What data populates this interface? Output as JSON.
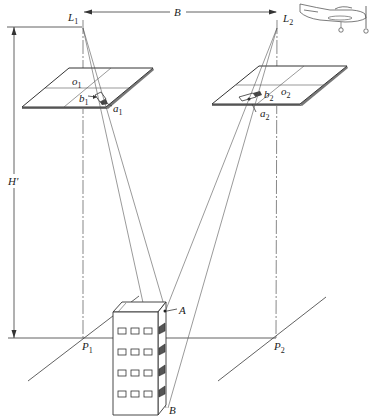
{
  "figure": {
    "labels": {
      "L1": {
        "main": "L",
        "sub": "1"
      },
      "L2": {
        "main": "L",
        "sub": "2"
      },
      "B": "B",
      "H": "H'",
      "o1": {
        "main": "o",
        "sub": "1"
      },
      "o2": {
        "main": "o",
        "sub": "2"
      },
      "a1": {
        "main": "a",
        "sub": "1"
      },
      "a2": {
        "main": "a",
        "sub": "2"
      },
      "b1": {
        "main": "b",
        "sub": "1"
      },
      "b2": {
        "main": "b",
        "sub": "2"
      },
      "P1": {
        "main": "P",
        "sub": "1"
      },
      "P2": {
        "main": "P",
        "sub": "2"
      },
      "A": "A",
      "Bpt": "B"
    },
    "elements": {
      "exposure_stations": [
        "L1",
        "L2"
      ],
      "air_base": "B",
      "flying_height": "H'",
      "photos": [
        "left photo (o1, a1, b1)",
        "right photo (o2, a2, b2)"
      ],
      "ground_nadir_points": [
        "P1",
        "P2"
      ],
      "object": "building with top point A and base point B",
      "aircraft": "propeller airplane at upper right"
    },
    "colors": {
      "line": "#3a3a3a",
      "background": "#ffffff",
      "text": "#222222"
    }
  }
}
